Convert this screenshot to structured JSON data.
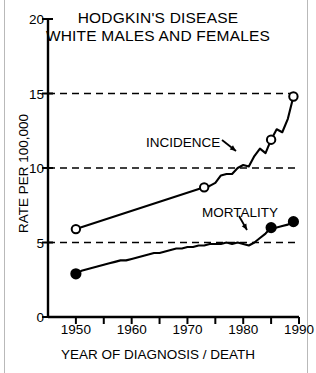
{
  "chart_data": {
    "type": "line",
    "title": "HODGKIN'S DISEASE WHITE MALES AND FEMALES",
    "title_line1": "HODGKIN'S DISEASE",
    "title_line2": "WHITE MALES AND FEMALES",
    "xlabel": "YEAR OF DIAGNOSIS / DEATH",
    "ylabel": "RATE PER 100,000",
    "xlim": [
      1945,
      1990
    ],
    "ylim": [
      0,
      20
    ],
    "yticks": [
      0,
      5,
      10,
      15,
      20
    ],
    "ytick_labels": [
      "0",
      "5",
      "10",
      "15",
      "20"
    ],
    "xticks": [
      1950,
      1955,
      1960,
      1965,
      1970,
      1975,
      1980,
      1985,
      1990
    ],
    "xtick_labels": [
      "1950",
      "",
      "1960",
      "",
      "1970",
      "",
      "1980",
      "",
      "1990"
    ],
    "gridlines": [
      5,
      10,
      15
    ],
    "grid": "dashed-horizontal",
    "legend": "inline-annotations",
    "annotations": [
      {
        "text": "INCIDENCE",
        "x": 1972,
        "y": 11.6
      },
      {
        "text": "MORTALITY",
        "x": 1981,
        "y": 6.9
      }
    ],
    "series": [
      {
        "name": "INCIDENCE",
        "marker": "open-circle",
        "x": [
          1950,
          1973,
          1974,
          1975,
          1976,
          1977,
          1978,
          1979,
          1980,
          1981,
          1982,
          1983,
          1984,
          1985,
          1986,
          1987,
          1988,
          1989
        ],
        "values": [
          5.9,
          8.7,
          8.8,
          9.0,
          9.5,
          9.6,
          9.6,
          10.0,
          10.2,
          10.1,
          10.8,
          11.3,
          11.0,
          11.9,
          12.6,
          12.4,
          13.3,
          14.8
        ],
        "marker_points": [
          {
            "x": 1950,
            "y": 5.9
          },
          {
            "x": 1973,
            "y": 8.7
          },
          {
            "x": 1985,
            "y": 11.9
          },
          {
            "x": 1989,
            "y": 14.8
          }
        ]
      },
      {
        "name": "MORTALITY",
        "marker": "filled-circle",
        "x": [
          1950,
          1951,
          1952,
          1953,
          1954,
          1955,
          1956,
          1957,
          1958,
          1959,
          1960,
          1961,
          1962,
          1963,
          1964,
          1965,
          1966,
          1967,
          1968,
          1969,
          1970,
          1971,
          1972,
          1973,
          1974,
          1975,
          1976,
          1977,
          1978,
          1979,
          1980,
          1981,
          1982,
          1983,
          1984,
          1985,
          1986,
          1987,
          1988,
          1989
        ],
        "values": [
          2.9,
          3.1,
          3.2,
          3.3,
          3.4,
          3.5,
          3.6,
          3.7,
          3.8,
          3.8,
          3.9,
          4.0,
          4.1,
          4.2,
          4.3,
          4.3,
          4.4,
          4.5,
          4.6,
          4.6,
          4.7,
          4.7,
          4.8,
          4.8,
          4.9,
          4.9,
          4.9,
          5.0,
          4.9,
          5.0,
          4.9,
          4.8,
          5.0,
          5.3,
          5.6,
          6.0,
          6.0,
          6.1,
          6.2,
          6.4
        ],
        "marker_points": [
          {
            "x": 1950,
            "y": 2.9
          },
          {
            "x": 1985,
            "y": 6.0
          },
          {
            "x": 1989,
            "y": 6.4
          }
        ]
      }
    ]
  }
}
